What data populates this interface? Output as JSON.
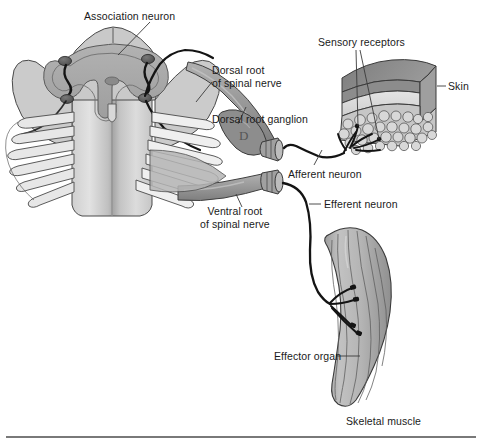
{
  "figure": {
    "background_color": "#ffffff",
    "width": 482,
    "height": 443
  },
  "labels": {
    "association_neuron": "Association neuron",
    "dorsal_root_line1": "Dorsal root",
    "dorsal_root_line2": "of spinal nerve",
    "dorsal_root_ganglion": "Dorsal root ganglion",
    "sensory_receptors": "Sensory receptors",
    "skin": "Skin",
    "afferent_neuron": "Afferent neuron",
    "efferent_neuron": "Efferent neuron",
    "ventral_root_line1": "Ventral root",
    "ventral_root_line2": "of spinal nerve",
    "effector_organ": "Effector organ",
    "skeletal_muscle": "Skeletal muscle"
  },
  "colors": {
    "white_matter_light": "#d9d9d9",
    "white_matter_mid": "#bdbdbd",
    "gray_matter": "#a8a8a8",
    "gray_matter_dark": "#8f8f8f",
    "nerve_root": "#9c9c9c",
    "nerve_root_dark": "#7f7f7f",
    "skin_epidermis": "#8a8a8a",
    "skin_dermis": "#d6d6d6",
    "skin_subcutaneous": "#c3c3c3",
    "muscle_fill": "#b5b5b5",
    "muscle_shade": "#9a9a9a",
    "outline": "#3a3a3a",
    "neuron_black": "#1a1a1a",
    "leader_line": "#3a3a3a",
    "rule": "#4d4d4d",
    "text": "#1a1a1a"
  },
  "structures": [
    {
      "name": "spinal-cord-cross-section",
      "description": "Transverse section of spinal cord with butterfly-shaped gray matter"
    },
    {
      "name": "gray-matter",
      "description": "Butterfly / H-shaped central gray matter"
    },
    {
      "name": "association-neuron-cell",
      "description": "Interneuron cell bodies within gray matter"
    },
    {
      "name": "dorsal-rootlets",
      "description": "Fan of dorsal rootlets on left and right"
    },
    {
      "name": "dorsal-root-ganglion",
      "description": "Swollen ganglion on the dorsal root"
    },
    {
      "name": "ventral-root",
      "description": "Ventral root of spinal nerve"
    },
    {
      "name": "skin-block",
      "description": "Three-dimensional block of skin with epidermis, dermis and subcutaneous fat"
    },
    {
      "name": "sensory-receptor-endings",
      "description": "Branching free nerve endings in dermis"
    },
    {
      "name": "afferent-nerve-fiber",
      "description": "Sensory fiber from skin to dorsal root ganglion"
    },
    {
      "name": "efferent-nerve-fiber",
      "description": "Motor fiber from ventral root to skeletal muscle"
    },
    {
      "name": "skeletal-muscle",
      "description": "Fusiform skeletal muscle with neuromuscular junctions"
    },
    {
      "name": "bottom-rule",
      "description": "Horizontal divider rule at bottom of figure"
    }
  ]
}
